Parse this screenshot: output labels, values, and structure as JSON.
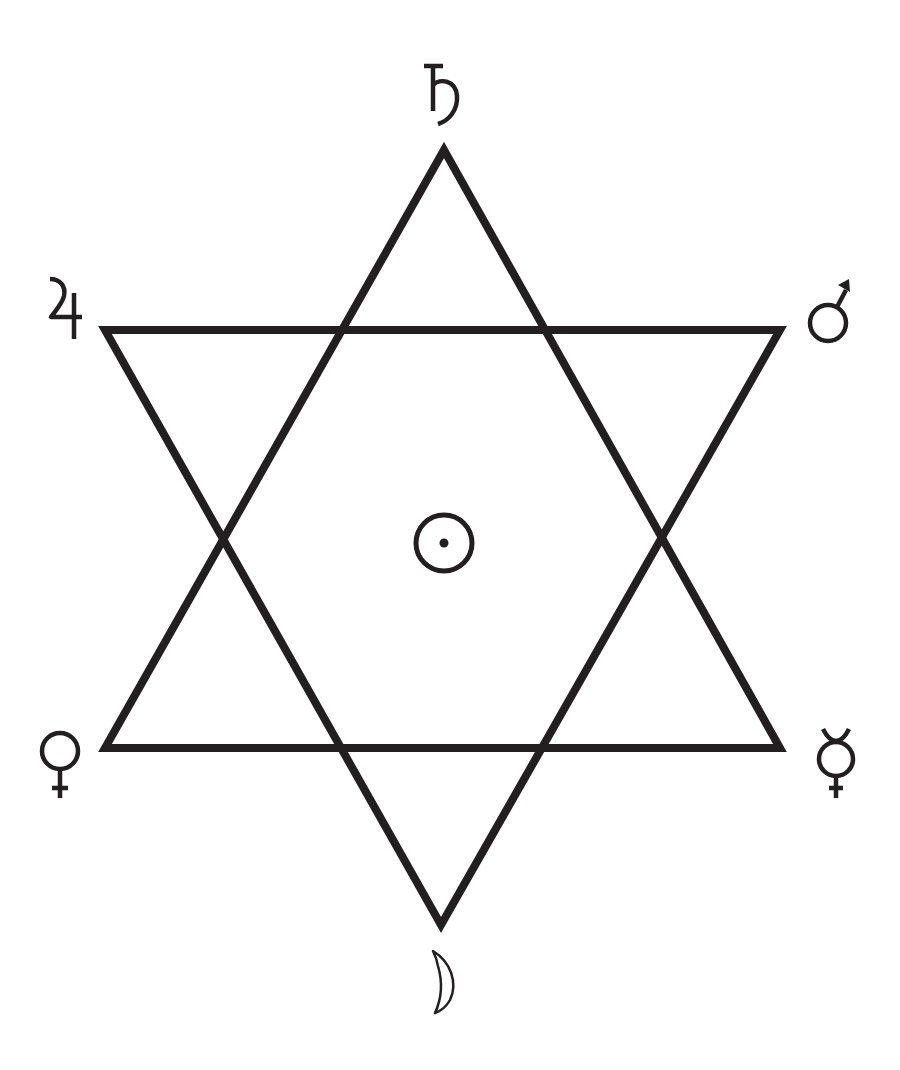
{
  "diagram": {
    "colors": {
      "background": "#ffffff",
      "stroke": "#231f20"
    },
    "stroke_width": 8,
    "triangles": [
      {
        "name": "upward-triangle",
        "points": [
          [
            444,
            150
          ],
          [
            780,
            748
          ],
          [
            105,
            748
          ]
        ]
      },
      {
        "name": "downward-triangle",
        "points": [
          [
            105,
            330
          ],
          [
            780,
            330
          ],
          [
            441,
            925
          ]
        ]
      }
    ],
    "planets": [
      {
        "name": "Saturn",
        "symbol": "♄",
        "icon": "saturn-icon",
        "position": "top",
        "x": 444,
        "y": 90
      },
      {
        "name": "Jupiter",
        "symbol": "♃",
        "icon": "jupiter-icon",
        "position": "upper-left",
        "x": 57,
        "y": 312
      },
      {
        "name": "Mars",
        "symbol": "♂",
        "icon": "mars-icon",
        "position": "upper-right",
        "x": 835,
        "y": 318
      },
      {
        "name": "Sun",
        "symbol": "☉",
        "icon": "sun-icon",
        "position": "center",
        "x": 444,
        "y": 543
      },
      {
        "name": "Venus",
        "symbol": "♀",
        "icon": "venus-icon",
        "position": "lower-left",
        "x": 60,
        "y": 760
      },
      {
        "name": "Mercury",
        "symbol": "☿",
        "icon": "mercury-icon",
        "position": "lower-right",
        "x": 836,
        "y": 760
      },
      {
        "name": "Moon",
        "symbol": "☽",
        "icon": "moon-icon",
        "position": "bottom",
        "x": 441,
        "y": 982
      }
    ]
  }
}
